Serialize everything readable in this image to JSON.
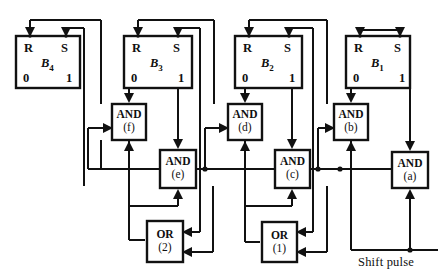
{
  "diagram": {
    "line_color": "#111111",
    "background": "#ffffff",
    "flipflops": [
      {
        "id": "B4",
        "name": "B",
        "subscript": "4",
        "reset_label": "R",
        "set_label": "S",
        "zero_label": "0",
        "one_label": "1",
        "x": 16,
        "y": 36,
        "w": 64,
        "h": 52
      },
      {
        "id": "B3",
        "name": "B",
        "subscript": "3",
        "reset_label": "R",
        "set_label": "S",
        "zero_label": "0",
        "one_label": "1",
        "x": 124,
        "y": 36,
        "w": 68,
        "h": 52
      },
      {
        "id": "B2",
        "name": "B",
        "subscript": "2",
        "reset_label": "R",
        "set_label": "S",
        "zero_label": "0",
        "one_label": "1",
        "x": 235,
        "y": 36,
        "w": 67,
        "h": 52
      },
      {
        "id": "B1",
        "name": "B",
        "subscript": "1",
        "reset_label": "R",
        "set_label": "S",
        "zero_label": "0",
        "one_label": "1",
        "x": 346,
        "y": 36,
        "w": 64,
        "h": 52
      }
    ],
    "gates": [
      {
        "id": "and-f",
        "type": "AND",
        "label": "AND",
        "tag": "(f)",
        "x": 112,
        "y": 104,
        "w": 34,
        "h": 36
      },
      {
        "id": "and-e",
        "type": "AND",
        "label": "AND",
        "tag": "(e)",
        "x": 160,
        "y": 150,
        "w": 36,
        "h": 38
      },
      {
        "id": "and-d",
        "type": "AND",
        "label": "AND",
        "tag": "(d)",
        "x": 228,
        "y": 104,
        "w": 34,
        "h": 36
      },
      {
        "id": "and-c",
        "type": "AND",
        "label": "AND",
        "tag": "(c)",
        "x": 275,
        "y": 150,
        "w": 35,
        "h": 38
      },
      {
        "id": "and-b",
        "type": "AND",
        "label": "AND",
        "tag": "(b)",
        "x": 334,
        "y": 104,
        "w": 34,
        "h": 36
      },
      {
        "id": "and-a",
        "type": "AND",
        "label": "AND",
        "tag": "(a)",
        "x": 392,
        "y": 152,
        "w": 36,
        "h": 36
      },
      {
        "id": "or-2",
        "type": "OR",
        "label": "OR",
        "tag": "(2)",
        "x": 147,
        "y": 221,
        "w": 36,
        "h": 41
      },
      {
        "id": "or-1",
        "type": "OR",
        "label": "OR",
        "tag": "(1)",
        "x": 262,
        "y": 222,
        "w": 35,
        "h": 40
      }
    ],
    "input_label": "Shift pulse"
  }
}
